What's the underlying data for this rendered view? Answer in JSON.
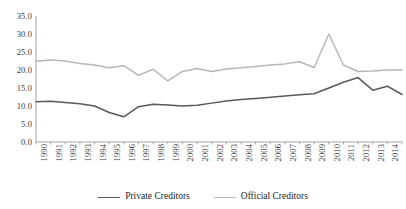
{
  "chart_data": {
    "type": "line",
    "title": "",
    "subtitle": "",
    "xlabel": "",
    "ylabel": "",
    "grid": false,
    "legend_position": "bottom-center",
    "ylim": [
      0.0,
      35.0
    ],
    "yticks": [
      "0.0",
      "5.0",
      "10.0",
      "15.0",
      "20.0",
      "25.0",
      "30.0",
      "35.0"
    ],
    "ytick_values": [
      0.0,
      5.0,
      10.0,
      15.0,
      20.0,
      25.0,
      30.0,
      35.0
    ],
    "categories": [
      "1990",
      "1991",
      "1992",
      "1993",
      "1994",
      "1995",
      "1996",
      "1997",
      "1998",
      "1999",
      "2000",
      "2001",
      "2002",
      "2003",
      "2004",
      "2005",
      "2006",
      "2007",
      "2008",
      "2009",
      "2010",
      "2011",
      "2012",
      "2013",
      "2014",
      "2015"
    ],
    "series": [
      {
        "name": "Private Creditors",
        "color": "#595959",
        "values": [
          11.2,
          11.3,
          11.0,
          10.6,
          10.0,
          8.2,
          7.0,
          9.8,
          10.5,
          10.3,
          10.0,
          10.2,
          10.8,
          11.4,
          11.8,
          12.1,
          12.4,
          12.8,
          13.1,
          13.4,
          15.0,
          16.6,
          17.9,
          14.4,
          15.5,
          13.2
        ]
      },
      {
        "name": "Official Creditors",
        "color": "#b7b7b7",
        "values": [
          22.4,
          22.8,
          22.5,
          21.8,
          21.4,
          20.6,
          21.2,
          18.5,
          20.2,
          17.0,
          19.6,
          20.4,
          19.6,
          20.3,
          20.6,
          21.0,
          21.4,
          21.7,
          22.3,
          20.7,
          30.0,
          21.4,
          19.6,
          19.7,
          20.0,
          20.0
        ]
      }
    ]
  },
  "legend": {
    "entries": [
      {
        "label": "Private Creditors"
      },
      {
        "label": "Official Creditors"
      }
    ]
  },
  "axis": {
    "axis_line_color": "#8c8c8c"
  }
}
